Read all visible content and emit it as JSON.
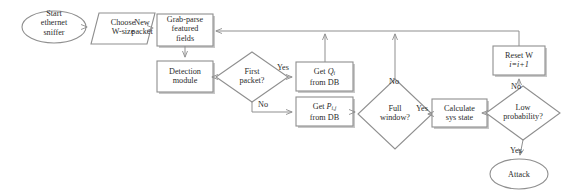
{
  "diagram": {
    "colors": {
      "stroke": "#8f8f8f",
      "shadow": "#c8c8c8",
      "text": "#2b2b2b",
      "background": "#ffffff"
    },
    "nodes": [
      {
        "id": "start",
        "shape": "ellipse",
        "label_lines": [
          "Start",
          "ethernet",
          "sniffer"
        ]
      },
      {
        "id": "choose-w",
        "shape": "parallelogram",
        "label_lines": [
          "Choose",
          "W-size"
        ]
      },
      {
        "id": "grab-parse",
        "shape": "rect",
        "label_lines": [
          "Grab-parse",
          "featured",
          "fields"
        ]
      },
      {
        "id": "detection",
        "shape": "rect",
        "label_lines": [
          "Detection",
          "module"
        ]
      },
      {
        "id": "first-packet",
        "shape": "diamond",
        "label_lines": [
          "First",
          "packet?"
        ]
      },
      {
        "id": "get-q",
        "shape": "rect",
        "label_lines": [
          "Get Qi",
          "from DB"
        ],
        "math": "Q_i"
      },
      {
        "id": "get-p",
        "shape": "rect",
        "label_lines": [
          "Get Pi,j",
          "from DB"
        ],
        "math": "P_ij"
      },
      {
        "id": "full-window",
        "shape": "diamond",
        "label_lines": [
          "Full",
          "window?"
        ]
      },
      {
        "id": "calculate",
        "shape": "rect",
        "label_lines": [
          "Calculate",
          "sys state"
        ]
      },
      {
        "id": "low-prob",
        "shape": "diamond",
        "label_lines": [
          "Low",
          "probability?"
        ]
      },
      {
        "id": "reset-w",
        "shape": "rect",
        "label_lines": [
          "Reset W",
          "i=i+1"
        ]
      },
      {
        "id": "attack",
        "shape": "ellipse",
        "label_lines": [
          "Attack"
        ]
      }
    ],
    "edge_labels": [
      {
        "id": "new-packet",
        "lines": [
          "New",
          "packet"
        ]
      },
      {
        "id": "first-packet-yes",
        "lines": [
          "Yes"
        ]
      },
      {
        "id": "first-packet-no",
        "lines": [
          "No"
        ]
      },
      {
        "id": "full-window-no",
        "lines": [
          "No"
        ]
      },
      {
        "id": "full-window-yes",
        "lines": [
          "Yes"
        ]
      },
      {
        "id": "low-prob-no",
        "lines": [
          "No"
        ]
      },
      {
        "id": "low-prob-yes",
        "lines": [
          "Yes"
        ]
      }
    ]
  }
}
